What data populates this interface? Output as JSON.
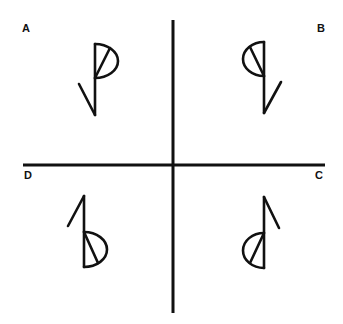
{
  "figure": {
    "colors": {
      "stroke": "#111111",
      "background": "#ffffff"
    },
    "axes": {
      "vertical": {
        "x": 173,
        "y1": 20,
        "y2": 313,
        "width": 3
      },
      "horizontal": {
        "y": 165,
        "x1": 23,
        "x2": 325,
        "width": 3
      }
    },
    "quadrants": [
      {
        "id": "A",
        "label": "A",
        "position": "top-left",
        "label_x": 22,
        "label_y": 32,
        "glyph": {
          "orientation": "half-disc top-right, tail bottom-left",
          "stem": {
            "x": 95,
            "y1": 44,
            "y2": 115
          },
          "half_disc": {
            "x": 95,
            "y1": 44,
            "y2": 78,
            "bulge_to_x": 118
          },
          "chord": {
            "x1": 95,
            "y1": 78,
            "x2": 110,
            "y2": 48
          },
          "tail": {
            "x1": 95,
            "y1": 115,
            "x2": 79,
            "y2": 84
          }
        }
      },
      {
        "id": "B",
        "label": "B",
        "position": "top-right",
        "label_x": 317,
        "label_y": 32,
        "glyph": {
          "orientation": "half-disc top-left, tail bottom-right",
          "stem": {
            "x": 264,
            "y1": 42,
            "y2": 113
          },
          "half_disc": {
            "x": 264,
            "y1": 42,
            "y2": 76,
            "bulge_to_x": 243
          },
          "chord": {
            "x1": 264,
            "y1": 76,
            "x2": 250,
            "y2": 47
          },
          "tail": {
            "x1": 264,
            "y1": 113,
            "x2": 281,
            "y2": 82
          }
        }
      },
      {
        "id": "C",
        "label": "C",
        "position": "bottom-right",
        "label_x": 315,
        "label_y": 179,
        "glyph": {
          "orientation": "half-disc bottom-left, tail top-right",
          "stem": {
            "x": 264,
            "y1": 197,
            "y2": 268
          },
          "half_disc": {
            "x": 264,
            "y1": 233,
            "y2": 268,
            "bulge_to_x": 243
          },
          "chord": {
            "x1": 264,
            "y1": 233,
            "x2": 250,
            "y2": 263
          },
          "tail": {
            "x1": 264,
            "y1": 197,
            "x2": 279,
            "y2": 228
          }
        }
      },
      {
        "id": "D",
        "label": "D",
        "position": "bottom-left",
        "label_x": 24,
        "label_y": 179,
        "glyph": {
          "orientation": "half-disc bottom-right, tail top-left",
          "stem": {
            "x": 84,
            "y1": 196,
            "y2": 267
          },
          "half_disc": {
            "x": 84,
            "y1": 232,
            "y2": 267,
            "bulge_to_x": 107
          },
          "chord": {
            "x1": 84,
            "y1": 232,
            "x2": 98,
            "y2": 263
          },
          "tail": {
            "x1": 84,
            "y1": 196,
            "x2": 68,
            "y2": 226
          }
        }
      }
    ]
  }
}
